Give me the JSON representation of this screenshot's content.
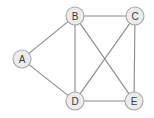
{
  "graph": {
    "title": "Undirected graph with five vertices",
    "background_color": "#ffffff",
    "node_fill_color": "#ececec",
    "node_stroke_color": "#a8a8a8",
    "edge_color": "#8a8a8a",
    "label_color": "#3a3a3a",
    "node_radius": 9,
    "nodes": [
      {
        "id": "A",
        "label": "A",
        "x": 22,
        "y": 59
      },
      {
        "id": "B",
        "label": "B",
        "x": 75,
        "y": 16
      },
      {
        "id": "C",
        "label": "C",
        "x": 135,
        "y": 16
      },
      {
        "id": "D",
        "label": "D",
        "x": 75,
        "y": 101
      },
      {
        "id": "E",
        "label": "E",
        "x": 134,
        "y": 101
      }
    ],
    "edges": [
      {
        "from": "A",
        "to": "B"
      },
      {
        "from": "A",
        "to": "D"
      },
      {
        "from": "B",
        "to": "C"
      },
      {
        "from": "B",
        "to": "D"
      },
      {
        "from": "B",
        "to": "E"
      },
      {
        "from": "C",
        "to": "D"
      },
      {
        "from": "C",
        "to": "E"
      },
      {
        "from": "D",
        "to": "E"
      }
    ]
  }
}
